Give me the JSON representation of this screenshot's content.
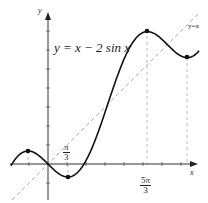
{
  "diagram": {
    "title": "y = x − 2 sin x",
    "axis_x_label": "x",
    "axis_y_label": "y",
    "line_label": "y=x",
    "ticks": {
      "pi_over_3": {
        "num": "π",
        "den": "3"
      },
      "five_pi_over_3": {
        "num": "5π",
        "den": "3"
      }
    },
    "colors": {
      "curve": "#111111",
      "axis": "#333333",
      "dashed": "#aaaaaa"
    }
  },
  "chart_data": {
    "type": "line",
    "title": "y = x − 2 sin x",
    "xlabel": "x",
    "ylabel": "y",
    "series": [
      {
        "name": "y = x − 2 sin x",
        "style": "solid",
        "points": [
          [
            -1.047,
            0.685
          ],
          [
            1.047,
            -0.685
          ],
          [
            5.236,
            6.968
          ],
          [
            7.33,
            5.597
          ]
        ]
      },
      {
        "name": "y = x",
        "style": "dashed"
      }
    ],
    "annotations": [
      "π/3",
      "5π/3",
      "y=x"
    ],
    "marked_points": [
      {
        "x": "-π/3",
        "y": 0.685,
        "type": "local max"
      },
      {
        "x": "π/3",
        "y": -0.685,
        "type": "local min"
      },
      {
        "x": "5π/3",
        "y": 6.968,
        "type": "local max"
      },
      {
        "x": "7π/3",
        "y": 5.597,
        "type": "local min"
      }
    ],
    "xlim": [
      -1.8,
      7.9
    ],
    "ylim": [
      -2.0,
      8.0
    ],
    "grid": false
  }
}
